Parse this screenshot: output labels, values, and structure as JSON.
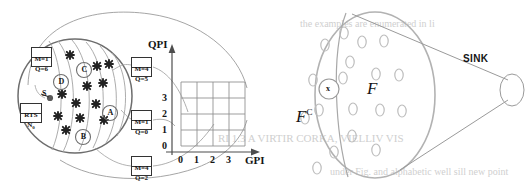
{
  "figure": {
    "left_panel": {
      "name": "source-cluster-diagram",
      "boxes": [
        {
          "id": "box-m1q6",
          "line1": "M=1",
          "line2": "Q=6",
          "x": 31,
          "y": 47,
          "w": 21,
          "h": 20
        },
        {
          "id": "box-rts",
          "line1": "RTS",
          "line2": "N0",
          "x": 20,
          "y": 103,
          "w": 22,
          "h": 20
        },
        {
          "id": "box-m4q5",
          "line1": "M=4",
          "line2": "Q=5",
          "x": 131,
          "y": 57,
          "w": 21,
          "h": 20
        },
        {
          "id": "box-m1q0",
          "line1": "M=1",
          "line2": "Q=0",
          "x": 131,
          "y": 110,
          "w": 21,
          "h": 20
        },
        {
          "id": "box-m4q2",
          "line1": "M=4",
          "line2": "Q=2",
          "x": 131,
          "y": 156,
          "w": 21,
          "h": 20
        }
      ],
      "nodes": [
        {
          "label": "A",
          "cx": 110,
          "cy": 113
        },
        {
          "label": "B",
          "cx": 83,
          "cy": 137
        },
        {
          "label": "C",
          "cx": 84,
          "cy": 70
        },
        {
          "label": "D",
          "cx": 61,
          "cy": 82
        },
        {
          "label": "S",
          "cx": 48,
          "cy": 98
        }
      ],
      "source_label": "S",
      "marker_positions": [
        [
          70,
          55
        ],
        [
          97,
          66
        ],
        [
          87,
          86
        ],
        [
          103,
          83
        ],
        [
          109,
          64
        ],
        [
          62,
          94
        ],
        [
          76,
          103
        ],
        [
          96,
          104
        ],
        [
          80,
          118
        ],
        [
          58,
          116
        ],
        [
          66,
          130
        ],
        [
          104,
          120
        ]
      ]
    },
    "chart": {
      "name": "qpi-gpi-grid",
      "y_axis_title": "QPI",
      "x_axis_title": "GPI",
      "x_ticks": [
        "0",
        "1",
        "2",
        "3"
      ],
      "y_ticks": [
        "0",
        "1",
        "2",
        "3"
      ],
      "grid_cols": 4,
      "grid_rows": 4
    },
    "right_panel": {
      "name": "sink-projection-diagram",
      "set_label_f": "F",
      "set_label_fc": "F",
      "set_label_fc_sup": "C",
      "point_label": "x",
      "sink_label": "SINK",
      "blob_count": 17
    }
  },
  "bleed_text": {
    "t1": "RI 1.3 A VIRTIR CORKA, VIELLIV VIS",
    "t2": "the  examples  are  enumerated  in  li",
    "t3": "under  Fig. and alphabetic well sill new point"
  },
  "colors": {
    "ink": "#141414",
    "line": "#8f8f8f",
    "grid": "#9a9a9a",
    "blob": "#b9b9b9",
    "bleed": "#d2d2d2"
  }
}
